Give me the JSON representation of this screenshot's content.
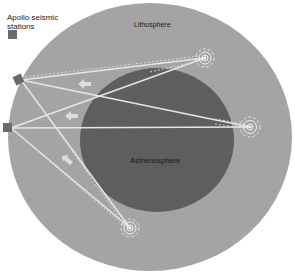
{
  "legend": {
    "title": "Apollo seismic stations",
    "swatch_color": "#6a6a6a"
  },
  "labels": {
    "lithosphere": "Lithosphere",
    "asthenosphere": "Asthenosphere"
  },
  "colors": {
    "background": "#ffffff",
    "lithosphere": "#a4a4a4",
    "asthenosphere": "#5e5e5e",
    "ray": "#e8e8e8",
    "station": "#6a6a6a"
  },
  "stations": [
    {
      "id": "station-upper",
      "x": 19,
      "y": 80
    },
    {
      "id": "station-lower",
      "x": 8,
      "y": 128
    }
  ],
  "quakes": [
    {
      "id": "quake-a",
      "x": 205,
      "y": 58
    },
    {
      "id": "quake-b",
      "x": 250,
      "y": 127
    },
    {
      "id": "quake-c",
      "x": 130,
      "y": 228
    }
  ],
  "arrows": [
    {
      "x": 84,
      "y": 84
    },
    {
      "x": 71,
      "y": 117
    },
    {
      "x": 67,
      "y": 160
    }
  ]
}
